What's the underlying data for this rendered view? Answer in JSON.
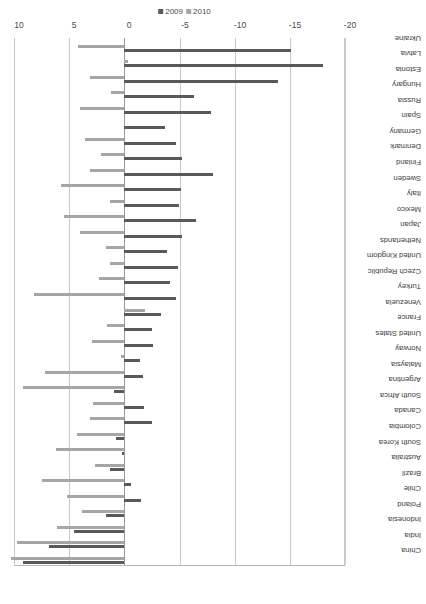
{
  "chart_data": {
    "type": "bar",
    "title": "",
    "xlabel": "",
    "ylabel": "",
    "ylim": [
      -20,
      10
    ],
    "yticks": [
      10,
      5,
      0,
      -5,
      -10,
      -15,
      -20
    ],
    "ytick_labels": [
      "10",
      "5",
      "0",
      "-5",
      "-10",
      "-15",
      "-20"
    ],
    "grid": true,
    "orientation": "vertical-rotated",
    "legend_position": "right",
    "categories": [
      "China",
      "India",
      "Indonesia",
      "Poland",
      "Chile",
      "Brazil",
      "Australia",
      "South Korea",
      "Colombia",
      "Canada",
      "South Africa",
      "Argentina",
      "Malaysia",
      "Norway",
      "United States",
      "France",
      "Venezuela",
      "Turkey",
      "Czech Republic",
      "United Kingdom",
      "Netherlands",
      "Japan",
      "Mexico",
      "Italy",
      "Sweden",
      "Finland",
      "Denmark",
      "Germany",
      "Spain",
      "Russia",
      "Hungary",
      "Estonia",
      "Latvia",
      "Ukraine"
    ],
    "series": [
      {
        "name": "2009",
        "color": "#595959",
        "values": [
          9.2,
          6.8,
          4.6,
          1.7,
          -1.5,
          -0.6,
          1.3,
          0.2,
          0.8,
          -2.5,
          -1.8,
          0.9,
          -1.7,
          -1.4,
          -2.6,
          -2.5,
          -3.3,
          -4.7,
          -4.1,
          -4.9,
          -3.9,
          -5.2,
          -6.5,
          -5.0,
          -5.1,
          -8.0,
          -5.2,
          -4.7,
          -3.7,
          -7.9,
          -6.3,
          -13.9,
          -18.0,
          -15.1
        ]
      },
      {
        "name": "2010",
        "color": "#a6a6a6",
        "values": [
          10.3,
          9.7,
          6.1,
          3.8,
          5.2,
          7.5,
          2.7,
          6.2,
          4.3,
          3.1,
          2.8,
          9.2,
          7.2,
          0.3,
          2.9,
          1.6,
          -1.9,
          8.2,
          2.3,
          1.3,
          1.7,
          4.0,
          5.5,
          1.3,
          5.7,
          3.1,
          2.1,
          3.6,
          -0.1,
          4.0,
          1.2,
          3.1,
          -0.3,
          4.2
        ]
      }
    ],
    "legend_entries": [
      "2009",
      "2010"
    ]
  }
}
